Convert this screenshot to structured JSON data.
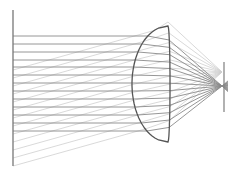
{
  "diagram": {
    "title": "",
    "colors": {
      "background": "#ffffff",
      "object_plane": "#777777",
      "parallel_ray": "#8a8a8a",
      "oblique_ray": "#cfcfcf",
      "lens": "#555555",
      "screen": "#888888"
    },
    "object_plane": {
      "x": 13,
      "y_top": 10,
      "y_bottom": 166
    },
    "screen": {
      "x": 224,
      "y_top": 62,
      "y_bottom": 112
    },
    "lens": {
      "top": [
        168,
        26
      ],
      "bottom": [
        167,
        142
      ],
      "left_vertex_x": 132,
      "center_y": 84
    },
    "focus_point": [
      222,
      86
    ],
    "parallel_ray_y": [
      36,
      44,
      52,
      60,
      67,
      75,
      83,
      91,
      99,
      107,
      115,
      123,
      131
    ],
    "oblique_ray_start_y": [
      70,
      78,
      86,
      94,
      102,
      110,
      118,
      126,
      134,
      142,
      150,
      158,
      166
    ],
    "oblique_slope": -0.28
  }
}
